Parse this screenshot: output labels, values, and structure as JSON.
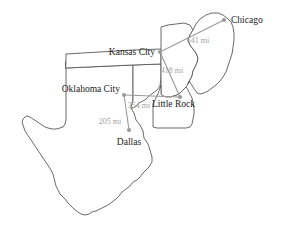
{
  "map": {
    "title": "Regional distance map",
    "background_color": "#ffffff",
    "state_outline_color": "#595959",
    "route_color": "#9a9a9a",
    "city_label_color": "#1a1a1a",
    "distance_label_color": "#a0a0a0",
    "cities": [
      {
        "id": "chicago",
        "name": "Chicago",
        "x": 224,
        "y": 20,
        "label_x": 231,
        "label_y": 23,
        "anchor": "start"
      },
      {
        "id": "kansas_city",
        "name": "Kansas City",
        "x": 160,
        "y": 52,
        "label_x": 155,
        "label_y": 55,
        "anchor": "end"
      },
      {
        "id": "oklahoma_city",
        "name": "Oklahoma City",
        "x": 124,
        "y": 95,
        "label_x": 120,
        "label_y": 92,
        "anchor": "end"
      },
      {
        "id": "little_rock",
        "name": "Little Rock",
        "x": 180,
        "y": 97,
        "label_x": 152,
        "label_y": 107,
        "anchor": "start"
      },
      {
        "id": "dallas",
        "name": "Dallas",
        "x": 129,
        "y": 130,
        "label_x": 129,
        "label_y": 145,
        "anchor": "middle"
      }
    ],
    "routes": [
      {
        "id": "kc-chicago",
        "from": "kansas_city",
        "to": "chicago",
        "distance": "541 mi",
        "label_x": 198,
        "label_y": 43
      },
      {
        "id": "kc-littlerock",
        "from": "kansas_city",
        "to": "little_rock",
        "distance": "418 mi",
        "label_x": 172,
        "label_y": 73
      },
      {
        "id": "okc-littlerock",
        "from": "oklahoma_city",
        "to": "little_rock",
        "distance": "354 mi",
        "label_x": 139,
        "label_y": 108
      },
      {
        "id": "okc-dallas",
        "from": "oklahoma_city",
        "to": "dallas",
        "distance": "205 mi",
        "label_x": 110,
        "label_y": 124
      }
    ]
  }
}
